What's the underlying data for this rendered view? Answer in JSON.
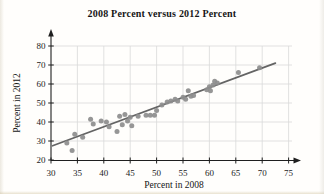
{
  "chart_data": {
    "type": "scatter",
    "title": "2008 Percent versus 2012 Percent",
    "xlabel": "Percent in 2008",
    "ylabel": "Percent in 2012",
    "xlim": [
      30,
      78
    ],
    "ylim": [
      20,
      85
    ],
    "x_ticks": [
      30,
      35,
      40,
      45,
      50,
      55,
      60,
      65,
      70,
      75
    ],
    "y_ticks": [
      20,
      30,
      40,
      50,
      60,
      70,
      80
    ],
    "grid": true,
    "legend": false,
    "points": [
      [
        33,
        29
      ],
      [
        34,
        25
      ],
      [
        34.5,
        33.5
      ],
      [
        36,
        32
      ],
      [
        37.5,
        41.5
      ],
      [
        38,
        39
      ],
      [
        39.5,
        40.5
      ],
      [
        40.5,
        40
      ],
      [
        41,
        37.5
      ],
      [
        42.5,
        35
      ],
      [
        43,
        43
      ],
      [
        43.5,
        38.5
      ],
      [
        44,
        44
      ],
      [
        44.5,
        40.5
      ],
      [
        45,
        42.5
      ],
      [
        45.3,
        38
      ],
      [
        46.5,
        43
      ],
      [
        48,
        43.5
      ],
      [
        48.8,
        43.5
      ],
      [
        49.6,
        43.5
      ],
      [
        50,
        46
      ],
      [
        51,
        49
      ],
      [
        52,
        50.5
      ],
      [
        52.7,
        51
      ],
      [
        53.5,
        52
      ],
      [
        54,
        51
      ],
      [
        55,
        53
      ],
      [
        55.5,
        52
      ],
      [
        56,
        56.5
      ],
      [
        56.5,
        53.5
      ],
      [
        57,
        54
      ],
      [
        59.5,
        57
      ],
      [
        60,
        58.5
      ],
      [
        60.2,
        56.5
      ],
      [
        60.7,
        59.5
      ],
      [
        61,
        61.5
      ],
      [
        61.5,
        60.5
      ],
      [
        65.5,
        66
      ],
      [
        69.5,
        68.5
      ]
    ],
    "trend_line": {
      "x1": 30.3,
      "y1": 27.5,
      "x2": 72.5,
      "y2": 71
    },
    "colors": {
      "point": "#8d8d8d",
      "trend": "#646464",
      "grid": "#d9d9d9",
      "axis": "#1f1f1f",
      "tick_text": "#1c1c1c"
    }
  }
}
